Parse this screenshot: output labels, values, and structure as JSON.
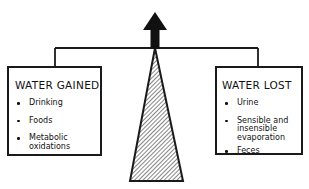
{
  "diagram": {
    "type": "balance-scale",
    "left_panel": {
      "title": "WATER GAINED",
      "items": [
        "Drinking",
        "Foods",
        "Metabolic oxidations"
      ]
    },
    "right_panel": {
      "title": "WATER LOST",
      "items": [
        "Urine",
        "Sensible and insensible evaporation",
        "Feces"
      ]
    },
    "center": {
      "arrow_direction": "up",
      "fulcrum": "hatched-triangle"
    },
    "colors": {
      "line": "#1a1a1a",
      "background": "#ffffff"
    }
  }
}
